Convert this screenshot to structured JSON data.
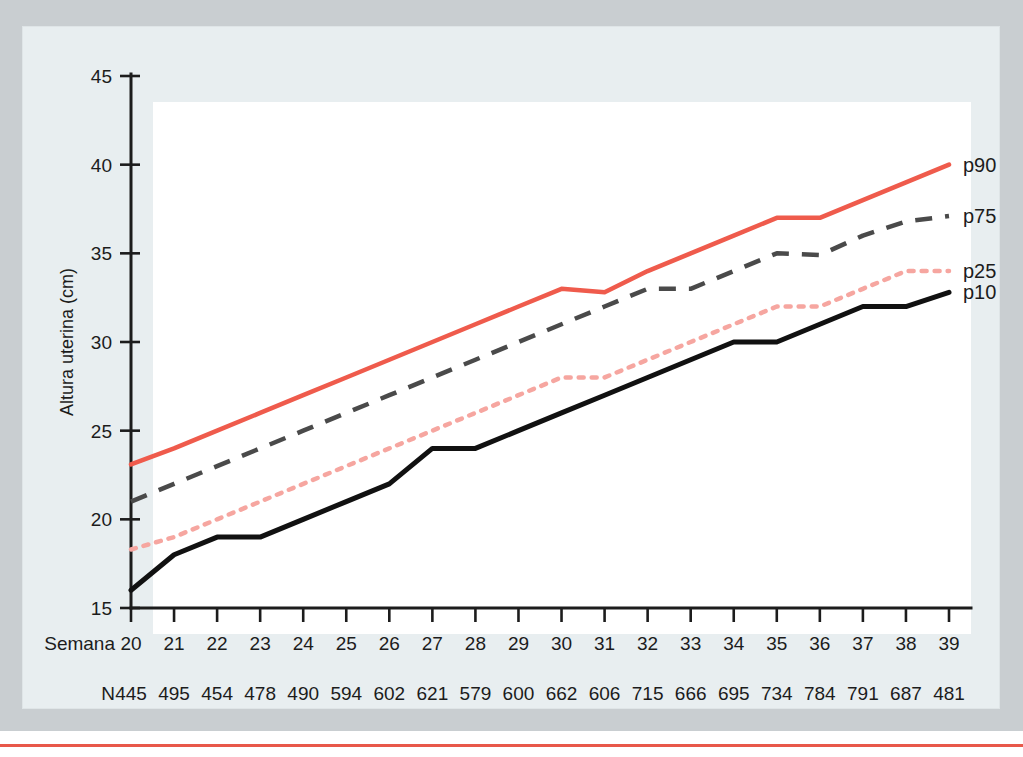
{
  "figure": {
    "background_color": "#c9ced1",
    "panel_color": "#e8eef0",
    "plot_color": "#ffffff",
    "foot_rule_color": "#e8584a",
    "axis_color": "#1c1c1c",
    "row_label_semana": "Semana",
    "row_label_n": "N"
  },
  "chart_data": {
    "type": "line",
    "title": "",
    "xlabel": "Semana",
    "ylabel": "Altura uterina (cm)",
    "xlim": [
      20,
      39
    ],
    "ylim": [
      15,
      45
    ],
    "yticks": [
      15,
      20,
      25,
      30,
      35,
      40,
      45
    ],
    "ytick_labels": [
      "15",
      "20",
      "25",
      "30",
      "35",
      "40",
      "45"
    ],
    "grid": false,
    "legend_position": "right-end-of-line",
    "x": [
      20,
      21,
      22,
      23,
      24,
      25,
      26,
      27,
      28,
      29,
      30,
      31,
      32,
      33,
      34,
      35,
      36,
      37,
      38,
      39
    ],
    "xtick_labels": [
      "20",
      "21",
      "22",
      "23",
      "24",
      "25",
      "26",
      "27",
      "28",
      "29",
      "30",
      "31",
      "32",
      "33",
      "34",
      "35",
      "36",
      "37",
      "38",
      "39"
    ],
    "n_values": [
      445,
      495,
      454,
      478,
      490,
      594,
      602,
      621,
      579,
      600,
      662,
      606,
      715,
      666,
      695,
      734,
      784,
      791,
      687,
      481
    ],
    "series": [
      {
        "name": "p90",
        "label": "p90",
        "color": "#ef5b4c",
        "style": "solid",
        "width": 4.5,
        "values": [
          23.1,
          24.0,
          25.0,
          26.0,
          27.0,
          28.0,
          29.0,
          30.0,
          31.0,
          32.0,
          33.0,
          32.8,
          34.0,
          35.0,
          36.0,
          37.0,
          37.0,
          38.0,
          39.0,
          40.0
        ]
      },
      {
        "name": "p75",
        "label": "p75",
        "color": "#4a4a4a",
        "style": "dashed",
        "width": 4.5,
        "values": [
          21.0,
          22.0,
          23.0,
          24.0,
          25.0,
          26.0,
          27.0,
          28.0,
          29.0,
          30.0,
          31.0,
          32.0,
          33.0,
          33.0,
          34.0,
          35.0,
          34.9,
          36.0,
          36.8,
          37.1
        ]
      },
      {
        "name": "p25",
        "label": "p25",
        "color": "#f6a6a0",
        "style": "dotted",
        "width": 4.5,
        "values": [
          18.3,
          19.0,
          20.0,
          21.0,
          22.0,
          23.0,
          24.0,
          25.0,
          26.0,
          27.0,
          28.0,
          28.0,
          29.0,
          30.0,
          31.0,
          32.0,
          32.0,
          33.0,
          34.0,
          34.0
        ]
      },
      {
        "name": "p10",
        "label": "p10",
        "color": "#111111",
        "style": "solid",
        "width": 5,
        "values": [
          16.0,
          18.0,
          19.0,
          19.0,
          20.0,
          21.0,
          22.0,
          24.0,
          24.0,
          25.0,
          26.0,
          27.0,
          28.0,
          29.0,
          30.0,
          30.0,
          31.0,
          32.0,
          32.0,
          32.8
        ]
      }
    ]
  }
}
